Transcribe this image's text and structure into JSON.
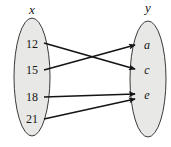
{
  "diagram": {
    "type": "mapping-diagram",
    "sets": {
      "domain": {
        "title": "x",
        "elements": [
          {
            "label": "12",
            "x": 32,
            "y": 45
          },
          {
            "label": "15",
            "x": 32,
            "y": 71
          },
          {
            "label": "18",
            "x": 32,
            "y": 99
          },
          {
            "label": "21",
            "x": 32,
            "y": 119
          }
        ],
        "ellipse": {
          "cx": 32,
          "cy": 77,
          "rx": 18,
          "ry": 59
        }
      },
      "range": {
        "title": "y",
        "elements": [
          {
            "label": "a",
            "x": 148,
            "y": 47
          },
          {
            "label": "c",
            "x": 148,
            "y": 71
          },
          {
            "label": "e",
            "x": 148,
            "y": 97
          }
        ],
        "ellipse": {
          "cx": 148,
          "cy": 79,
          "rx": 18,
          "ry": 58
        }
      }
    },
    "arrows": [
      {
        "from": "12",
        "to": "c",
        "x1": 44,
        "y1": 43,
        "x2": 137,
        "y2": 70
      },
      {
        "from": "15",
        "to": "a",
        "x1": 44,
        "y1": 70,
        "x2": 137,
        "y2": 45
      },
      {
        "from": "18",
        "to": "e",
        "x1": 44,
        "y1": 97,
        "x2": 137,
        "y2": 95
      },
      {
        "from": "21",
        "to": "e",
        "x1": 44,
        "y1": 119,
        "x2": 137,
        "y2": 98
      }
    ],
    "colors": {
      "set_fill": "#e8e8e6",
      "set_stroke": "#3a3a3a",
      "arrow": "#141414",
      "text": "#151515",
      "background": "#ffffff"
    }
  }
}
